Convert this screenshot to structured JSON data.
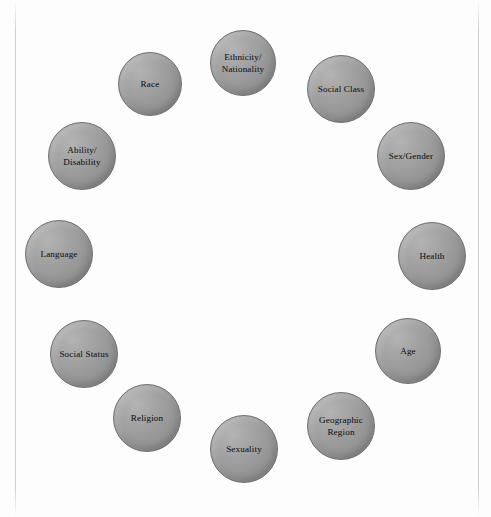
{
  "diagram": {
    "type": "circle-of-identity-nodes",
    "background_color": "#fdfdfd",
    "node_fill_color": "#9d9d9d",
    "node_border_color": "#6f6f6f",
    "node_text_color": "#1a1a1c",
    "node_count": 12,
    "nodes": [
      {
        "id": "ethnicity-nationality",
        "label": "Ethnicity/\nNationality",
        "cx": 243,
        "cy": 63,
        "r": 33
      },
      {
        "id": "social-class",
        "label": "Social Class",
        "cx": 341,
        "cy": 89,
        "r": 34
      },
      {
        "id": "sex-gender",
        "label": "Sex/Gender",
        "cx": 411,
        "cy": 156,
        "r": 34
      },
      {
        "id": "health",
        "label": "Health",
        "cx": 432,
        "cy": 256,
        "r": 34
      },
      {
        "id": "age",
        "label": "Age",
        "cx": 408,
        "cy": 351,
        "r": 33
      },
      {
        "id": "geographic-region",
        "label": "Geographic\nRegion",
        "cx": 341,
        "cy": 426,
        "r": 34
      },
      {
        "id": "sexuality",
        "label": "Sexuality",
        "cx": 244,
        "cy": 449,
        "r": 34
      },
      {
        "id": "religion",
        "label": "Religion",
        "cx": 147,
        "cy": 418,
        "r": 34
      },
      {
        "id": "social-status",
        "label": "Social Status",
        "cx": 84,
        "cy": 354,
        "r": 34
      },
      {
        "id": "language",
        "label": "Language",
        "cx": 59,
        "cy": 254,
        "r": 34
      },
      {
        "id": "ability-disability",
        "label": "Ability/\nDisability",
        "cx": 82,
        "cy": 156,
        "r": 34
      },
      {
        "id": "race",
        "label": "Race",
        "cx": 150,
        "cy": 84,
        "r": 32
      }
    ]
  },
  "page_marks": {
    "left_edge_line": true,
    "right_edge_line": true,
    "bottom_dotted_rule": true
  }
}
